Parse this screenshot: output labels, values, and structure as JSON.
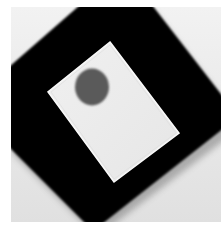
{
  "image": {
    "subject": "Black square board rotated diagonally with white rectangular card and gray circle",
    "colors": {
      "page_background": "#ffffff",
      "photo_background_top": "#f2f2f2",
      "photo_background_bottom": "#e2e2e2",
      "board": "#050505",
      "card": "#ececec",
      "card_edge": "#f8f8f8",
      "circle": "#5a5a5a"
    }
  }
}
